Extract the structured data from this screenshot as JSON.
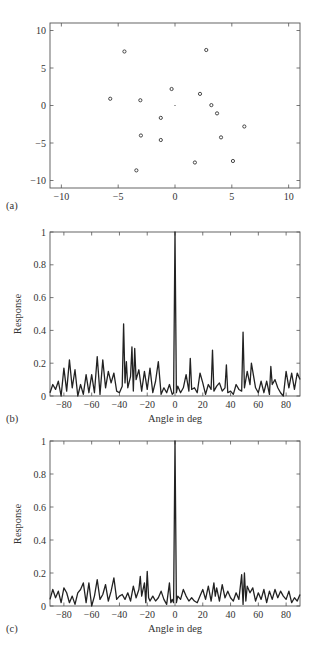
{
  "chart_data": [
    {
      "panel": "(a)",
      "type": "scatter",
      "title": "",
      "xlabel": "",
      "ylabel": "",
      "xlim": [
        -11,
        11
      ],
      "ylim": [
        -11,
        11
      ],
      "xticks": [
        -10,
        -5,
        0,
        5,
        10
      ],
      "yticks": [
        -10,
        -5,
        0,
        5,
        10
      ],
      "grid": false,
      "series": [
        {
          "name": "elements",
          "marker": "circle",
          "points": [
            [
              -4.45,
              7.2
            ],
            [
              2.75,
              7.4
            ],
            [
              -5.7,
              0.9
            ],
            [
              -3.05,
              0.7
            ],
            [
              -0.3,
              2.2
            ],
            [
              2.2,
              1.55
            ],
            [
              3.2,
              0.05
            ],
            [
              3.7,
              -1.05
            ],
            [
              -1.25,
              -1.65
            ],
            [
              6.1,
              -2.8
            ],
            [
              -3.0,
              -4.0
            ],
            [
              -1.25,
              -4.6
            ],
            [
              4.05,
              -4.25
            ],
            [
              1.75,
              -7.6
            ],
            [
              5.1,
              -7.4
            ],
            [
              -3.4,
              -8.65
            ]
          ]
        },
        {
          "name": "reference",
          "marker": "dot",
          "points": [
            [
              0,
              0
            ]
          ]
        }
      ]
    },
    {
      "panel": "(b)",
      "type": "line",
      "title": "",
      "xlabel": "Angle in deg",
      "ylabel": "Response",
      "xlim": [
        -90,
        90
      ],
      "ylim": [
        0,
        1
      ],
      "xticks": [
        -80,
        -60,
        -40,
        -20,
        0,
        20,
        40,
        60,
        80
      ],
      "yticks": [
        0,
        0.2,
        0.4,
        0.6,
        0.8,
        1
      ],
      "ytick_labels": [
        "0",
        "0.2",
        "0.4",
        "0.6",
        "0.8",
        "1"
      ],
      "grid": false,
      "peaks": [
        {
          "x": 0,
          "y": 1.0
        },
        {
          "x": -37,
          "y": 0.44
        },
        {
          "x": 49,
          "y": 0.39
        },
        {
          "x": -31,
          "y": 0.3
        },
        {
          "x": -29,
          "y": 0.29
        },
        {
          "x": 27,
          "y": 0.28
        },
        {
          "x": -58,
          "y": 0.24
        },
        {
          "x": 11,
          "y": 0.23
        },
        {
          "x": -78,
          "y": 0.22
        },
        {
          "x": -53,
          "y": 0.22
        },
        {
          "x": -12,
          "y": 0.21
        },
        {
          "x": -35,
          "y": 0.21
        },
        {
          "x": 55,
          "y": 0.2
        },
        {
          "x": 37,
          "y": 0.19
        },
        {
          "x": 69,
          "y": 0.18
        }
      ],
      "x": [
        -90,
        -88,
        -86,
        -84,
        -82,
        -80,
        -78,
        -76,
        -74,
        -72,
        -70,
        -68,
        -66,
        -64,
        -62,
        -60,
        -58,
        -56,
        -54,
        -52,
        -50,
        -48,
        -46,
        -44,
        -42,
        -40,
        -38,
        -37,
        -36,
        -35,
        -34,
        -32,
        -31,
        -30,
        -29,
        -28,
        -26,
        -24,
        -22,
        -20,
        -18,
        -16,
        -14,
        -12,
        -10,
        -8,
        -6,
        -4,
        -2,
        -1,
        0,
        1,
        2,
        4,
        6,
        8,
        10,
        11,
        12,
        14,
        16,
        18,
        20,
        22,
        24,
        26,
        27,
        28,
        30,
        32,
        34,
        36,
        37,
        38,
        40,
        42,
        44,
        46,
        48,
        49,
        50,
        52,
        54,
        55,
        56,
        58,
        60,
        62,
        64,
        66,
        68,
        69,
        70,
        72,
        74,
        76,
        78,
        80,
        82,
        84,
        86,
        88,
        90
      ],
      "values": [
        0.02,
        0.07,
        0.04,
        0.09,
        0.0,
        0.17,
        0.03,
        0.22,
        0.05,
        0.16,
        0.0,
        0.07,
        0.01,
        0.13,
        0.02,
        0.13,
        0.02,
        0.24,
        0.01,
        0.22,
        0.05,
        0.15,
        0.08,
        0.14,
        0.03,
        0.02,
        0.06,
        0.44,
        0.08,
        0.21,
        0.05,
        0.12,
        0.3,
        0.03,
        0.29,
        0.1,
        0.16,
        0.03,
        0.15,
        0.04,
        0.17,
        0.02,
        0.09,
        0.21,
        0.01,
        0.05,
        0.02,
        0.07,
        0.01,
        0.02,
        1.0,
        0.02,
        0.06,
        0.02,
        0.05,
        0.13,
        0.03,
        0.23,
        0.04,
        0.05,
        0.02,
        0.14,
        0.08,
        0.01,
        0.07,
        0.04,
        0.28,
        0.03,
        0.06,
        0.08,
        0.03,
        0.05,
        0.19,
        0.02,
        0.03,
        0.01,
        0.07,
        0.04,
        0.03,
        0.39,
        0.05,
        0.15,
        0.07,
        0.2,
        0.15,
        0.05,
        0.02,
        0.09,
        0.02,
        0.09,
        0.01,
        0.18,
        0.07,
        0.1,
        0.05,
        0.02,
        0.0,
        0.15,
        0.05,
        0.14,
        0.04,
        0.14,
        0.1
      ]
    },
    {
      "panel": "(c)",
      "type": "line",
      "title": "",
      "xlabel": "Angle in deg",
      "ylabel": "Response",
      "xlim": [
        -90,
        90
      ],
      "ylim": [
        0,
        1
      ],
      "xticks": [
        -80,
        -60,
        -40,
        -20,
        0,
        20,
        40,
        60,
        80
      ],
      "yticks": [
        0,
        0.2,
        0.4,
        0.6,
        0.8,
        1
      ],
      "ytick_labels": [
        "0",
        "0.2",
        "0.4",
        "0.6",
        "0.8",
        "1"
      ],
      "grid": false,
      "peaks": [
        {
          "x": 0,
          "y": 1.0
        },
        {
          "x": -20,
          "y": 0.21
        },
        {
          "x": 51,
          "y": 0.2
        },
        {
          "x": 48,
          "y": 0.19
        },
        {
          "x": -25,
          "y": 0.18
        },
        {
          "x": -43,
          "y": 0.17
        },
        {
          "x": -56,
          "y": 0.16
        },
        {
          "x": -62,
          "y": 0.14
        },
        {
          "x": 29,
          "y": 0.14
        },
        {
          "x": -4,
          "y": 0.14
        }
      ],
      "x": [
        -90,
        -88,
        -86,
        -84,
        -82,
        -80,
        -78,
        -76,
        -74,
        -72,
        -70,
        -68,
        -66,
        -64,
        -62,
        -60,
        -58,
        -56,
        -54,
        -52,
        -50,
        -48,
        -46,
        -44,
        -42,
        -40,
        -38,
        -36,
        -34,
        -32,
        -30,
        -28,
        -26,
        -25,
        -24,
        -22,
        -21,
        -20,
        -19,
        -18,
        -16,
        -14,
        -12,
        -10,
        -8,
        -6,
        -4,
        -3,
        -2,
        -1,
        0,
        1,
        2,
        4,
        6,
        8,
        10,
        12,
        14,
        16,
        18,
        20,
        22,
        24,
        26,
        28,
        29,
        30,
        32,
        34,
        36,
        38,
        40,
        42,
        44,
        46,
        48,
        49,
        50,
        51,
        52,
        54,
        56,
        58,
        60,
        62,
        64,
        66,
        68,
        70,
        72,
        74,
        76,
        78,
        80,
        82,
        84,
        86,
        88,
        90
      ],
      "values": [
        0.04,
        0.1,
        0.05,
        0.09,
        0.02,
        0.11,
        0.08,
        0.02,
        0.06,
        0.01,
        0.08,
        0.1,
        0.14,
        0.02,
        0.14,
        0.0,
        0.06,
        0.16,
        0.04,
        0.07,
        0.13,
        0.03,
        0.09,
        0.17,
        0.04,
        0.06,
        0.07,
        0.04,
        0.08,
        0.03,
        0.12,
        0.05,
        0.1,
        0.18,
        0.06,
        0.14,
        0.02,
        0.21,
        0.05,
        0.03,
        0.06,
        0.03,
        0.05,
        0.09,
        0.04,
        0.01,
        0.14,
        0.02,
        0.04,
        0.02,
        1.0,
        0.02,
        0.06,
        0.04,
        0.1,
        0.06,
        0.03,
        0.05,
        0.03,
        0.02,
        0.06,
        0.1,
        0.04,
        0.12,
        0.03,
        0.14,
        0.06,
        0.11,
        0.03,
        0.13,
        0.05,
        0.09,
        0.05,
        0.03,
        0.08,
        0.04,
        0.19,
        0.01,
        0.2,
        0.03,
        0.12,
        0.08,
        0.11,
        0.03,
        0.08,
        0.04,
        0.1,
        0.02,
        0.09,
        0.04,
        0.1,
        0.05,
        0.09,
        0.06,
        0.04,
        0.09,
        0.02,
        0.05,
        0.03,
        0.07,
        0.05
      ]
    }
  ],
  "panels": {
    "a": {
      "label": "(a)"
    },
    "b": {
      "label": "(b)",
      "xlabel": "Angle in deg",
      "ylabel": "Response"
    },
    "c": {
      "label": "(c)",
      "xlabel": "Angle in deg",
      "ylabel": "Response"
    }
  }
}
